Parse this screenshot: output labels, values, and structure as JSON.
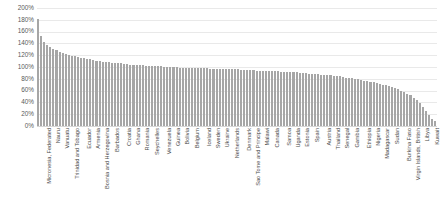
{
  "chart_data": {
    "type": "bar",
    "title": "",
    "xlabel": "",
    "ylabel": "",
    "ylim": [
      0,
      200
    ],
    "y_tick_step": 20,
    "y_tick_suffix": "%",
    "grid": true,
    "legend": "none",
    "bar_color": "#a6a6a6",
    "y_ticks": [
      "200%",
      "180%",
      "160%",
      "140%",
      "120%",
      "100%",
      "80%",
      "60%",
      "40%",
      "20%",
      "0%"
    ],
    "labeled_categories": [
      "Micronesia, Federated",
      "Nauru",
      "Vanuatu",
      "Trinidad and Tobago",
      "Ecuador",
      "Armenia",
      "Bosnia and Herzegovina",
      "Barbados",
      "Croatia",
      "Ghana",
      "Romania",
      "Seychelles",
      "Venezuela",
      "Guinea",
      "Bolivia",
      "Belgium",
      "Iceland",
      "Sweden",
      "Ukraine",
      "Netherlands",
      "Denmark",
      "Sao Tome and Principe",
      "Malawi",
      "Canada",
      "Samoa",
      "Uganda",
      "Estonia",
      "Spain",
      "Austria",
      "Thailand",
      "Senegal",
      "Gambia",
      "Ethiopia",
      "Nigeria",
      "Madagascar",
      "Sudan",
      "Burkina Faso",
      "Virgin Islands, British",
      "Libya",
      "Kuwait"
    ],
    "values": [
      181,
      152,
      143,
      138,
      134,
      131,
      128,
      126,
      124,
      122,
      120,
      119,
      118,
      117,
      116,
      115,
      114,
      113,
      112,
      111,
      110,
      109,
      108,
      108,
      107,
      107,
      106,
      106,
      105,
      105,
      104,
      104,
      103,
      103,
      103,
      102,
      102,
      102,
      101,
      101,
      101,
      100,
      100,
      100,
      100,
      100,
      99,
      99,
      99,
      99,
      99,
      98,
      98,
      98,
      98,
      98,
      97,
      97,
      97,
      97,
      97,
      96,
      96,
      96,
      96,
      96,
      95,
      95,
      95,
      95,
      95,
      94,
      94,
      94,
      94,
      93,
      93,
      93,
      93,
      92,
      92,
      92,
      91,
      91,
      91,
      90,
      90,
      90,
      89,
      89,
      88,
      88,
      87,
      87,
      86,
      86,
      85,
      84,
      84,
      83,
      82,
      81,
      81,
      80,
      79,
      78,
      77,
      76,
      75,
      74,
      73,
      72,
      70,
      69,
      67,
      66,
      64,
      62,
      60,
      58,
      55,
      52,
      48,
      44,
      39,
      33,
      26,
      18,
      12,
      9
    ]
  }
}
